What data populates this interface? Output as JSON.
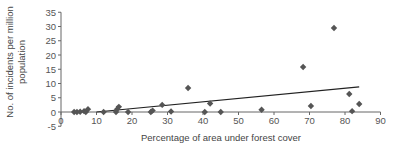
{
  "chart_data": {
    "type": "scatter",
    "title": "",
    "xlabel": "Percentage of area under forest cover",
    "ylabel": "No. of incidents per million population",
    "ylabel_lines": [
      "No. of incidents per million",
      "population"
    ],
    "xlim": [
      0,
      90
    ],
    "ylim": [
      -5,
      35
    ],
    "x_ticks": [
      0,
      10,
      20,
      30,
      40,
      50,
      60,
      70,
      80,
      90
    ],
    "y_ticks": [
      -5,
      0,
      5,
      10,
      15,
      20,
      25,
      30,
      35
    ],
    "grid": false,
    "legend": "none",
    "marker": "diamond",
    "colors": {
      "marker": "#555555",
      "trendline": "#222222",
      "axis": "#666666"
    },
    "series": [
      {
        "name": "Observations",
        "points": [
          {
            "x": 3.7,
            "y": 0.0
          },
          {
            "x": 4.5,
            "y": 0.0
          },
          {
            "x": 5.4,
            "y": 0.1
          },
          {
            "x": 6.5,
            "y": 0.3
          },
          {
            "x": 7.0,
            "y": 0.0
          },
          {
            "x": 7.6,
            "y": 1.0
          },
          {
            "x": 12.0,
            "y": 0.0
          },
          {
            "x": 15.5,
            "y": 0.0
          },
          {
            "x": 15.8,
            "y": 1.0
          },
          {
            "x": 16.3,
            "y": 1.8
          },
          {
            "x": 18.9,
            "y": 0.0
          },
          {
            "x": 25.3,
            "y": 0.0
          },
          {
            "x": 25.8,
            "y": 0.5
          },
          {
            "x": 28.5,
            "y": 2.5
          },
          {
            "x": 31.0,
            "y": 0.2
          },
          {
            "x": 35.8,
            "y": 8.4
          },
          {
            "x": 40.5,
            "y": 0.0
          },
          {
            "x": 42.0,
            "y": 3.0
          },
          {
            "x": 45.0,
            "y": 0.0
          },
          {
            "x": 56.5,
            "y": 0.8
          },
          {
            "x": 68.2,
            "y": 15.8
          },
          {
            "x": 70.4,
            "y": 2.1
          },
          {
            "x": 76.9,
            "y": 29.5
          },
          {
            "x": 81.2,
            "y": 6.3
          },
          {
            "x": 82.0,
            "y": 0.3
          },
          {
            "x": 84.0,
            "y": 2.8
          }
        ]
      }
    ],
    "trendline": {
      "type": "linear",
      "x_start": 10.0,
      "y_start": 0.0,
      "x_end": 84.0,
      "y_end": 8.8
    }
  }
}
